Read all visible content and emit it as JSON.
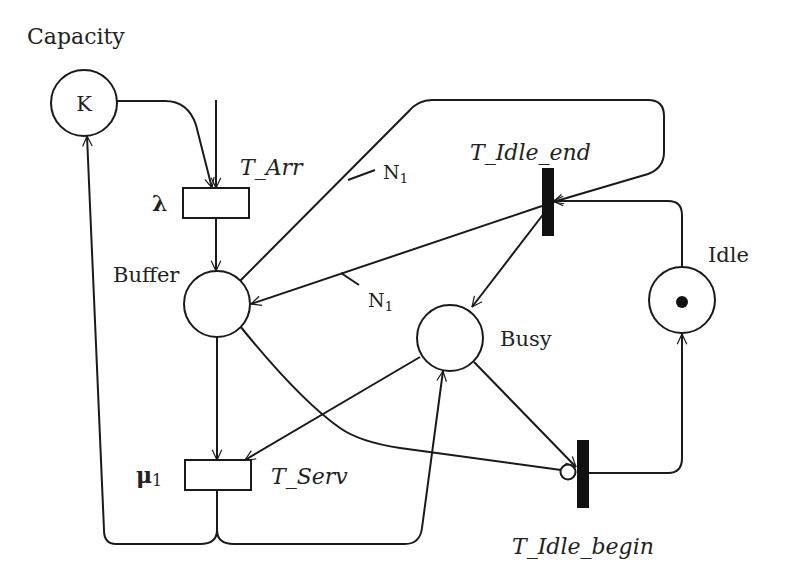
{
  "diagram": {
    "type": "petri-net",
    "places": {
      "capacity": {
        "title": "Capacity",
        "inner_label": "K"
      },
      "buffer": {
        "label": "Buffer"
      },
      "busy": {
        "label": "Busy"
      },
      "idle": {
        "label": "Idle",
        "tokens": 1
      }
    },
    "transitions": {
      "t_arr": {
        "label": "T_Arr",
        "rate": "λ",
        "kind": "timed"
      },
      "t_serv": {
        "label": "T_Serv",
        "rate": "μ",
        "rate_sub": "1",
        "kind": "timed"
      },
      "t_idle_end": {
        "label": "T_Idle_end",
        "kind": "immediate"
      },
      "t_idle_begin": {
        "label": "T_Idle_begin",
        "kind": "immediate"
      }
    },
    "arc_weights": {
      "upper": {
        "main": "N",
        "sub": "1"
      },
      "lower": {
        "main": "N",
        "sub": "1"
      }
    },
    "arcs": [
      {
        "from": "capacity",
        "to": "t_arr"
      },
      {
        "from": "external",
        "to": "t_arr"
      },
      {
        "from": "t_arr",
        "to": "buffer"
      },
      {
        "from": "buffer",
        "to": "t_idle_end",
        "weight": "N1"
      },
      {
        "from": "t_idle_end",
        "to": "buffer",
        "weight": "N1"
      },
      {
        "from": "t_idle_end",
        "to": "busy"
      },
      {
        "from": "idle",
        "to": "t_idle_end"
      },
      {
        "from": "buffer",
        "to": "t_serv"
      },
      {
        "from": "busy",
        "to": "t_serv"
      },
      {
        "from": "t_serv",
        "to": "capacity"
      },
      {
        "from": "t_serv",
        "to": "busy"
      },
      {
        "from": "busy",
        "to": "t_idle_begin"
      },
      {
        "from": "buffer",
        "to": "t_idle_begin",
        "type": "inhibitor"
      },
      {
        "from": "t_idle_begin",
        "to": "idle"
      }
    ],
    "colors": {
      "stroke": "#1a1a1a",
      "background": "#ffffff"
    }
  }
}
